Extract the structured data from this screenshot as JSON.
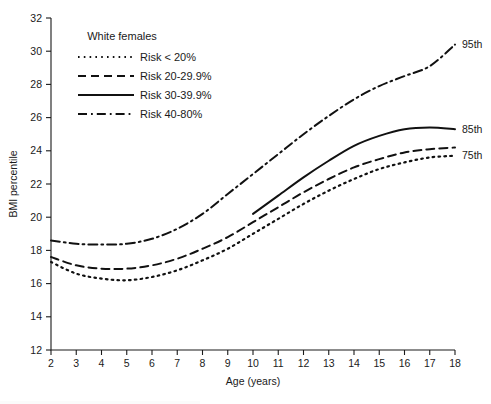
{
  "chart_data": {
    "type": "line",
    "title": "",
    "xlabel": "Age (years)",
    "ylabel": "BMI percentile",
    "xlim": [
      2,
      18
    ],
    "ylim": [
      12,
      32
    ],
    "xticks": [
      2,
      3,
      4,
      5,
      6,
      7,
      8,
      9,
      10,
      11,
      12,
      13,
      14,
      15,
      16,
      17,
      18
    ],
    "yticks": [
      12,
      14,
      16,
      18,
      20,
      22,
      24,
      26,
      28,
      30,
      32
    ],
    "grid": false,
    "legend_position": "upper-left-inside",
    "legend_title": "White females",
    "series": [
      {
        "name": "Risk < 20%",
        "style": "dotted",
        "x": [
          2,
          3,
          4,
          5,
          6,
          7,
          8,
          9,
          10,
          11,
          12,
          13,
          14,
          15,
          16,
          17,
          18
        ],
        "y": [
          17.3,
          16.6,
          16.3,
          16.2,
          16.4,
          16.8,
          17.4,
          18.1,
          19.0,
          19.9,
          20.8,
          21.6,
          22.3,
          22.9,
          23.3,
          23.6,
          23.7
        ]
      },
      {
        "name": "Risk 20-29.9%",
        "style": "dashed",
        "x": [
          2,
          3,
          4,
          5,
          6,
          7,
          8,
          9,
          10,
          11,
          12,
          13,
          14,
          15,
          16,
          17,
          18
        ],
        "y": [
          17.6,
          17.1,
          16.9,
          16.9,
          17.1,
          17.5,
          18.1,
          18.8,
          19.7,
          20.6,
          21.5,
          22.3,
          23.0,
          23.5,
          23.9,
          24.1,
          24.2
        ]
      },
      {
        "name": "Risk 30-39.9%",
        "style": "solid",
        "x": [
          10,
          11,
          12,
          13,
          14,
          15,
          16,
          17,
          18
        ],
        "y": [
          20.2,
          21.3,
          22.4,
          23.4,
          24.3,
          24.9,
          25.3,
          25.4,
          25.3
        ]
      },
      {
        "name": "Risk 40-80%",
        "style": "dashdot",
        "x": [
          2,
          3,
          4,
          5,
          6,
          7,
          8,
          9,
          10,
          11,
          12,
          13,
          14,
          15,
          16,
          17,
          18
        ],
        "y": [
          18.6,
          18.4,
          18.35,
          18.4,
          18.7,
          19.3,
          20.2,
          21.4,
          22.6,
          23.8,
          25.0,
          26.1,
          27.1,
          27.9,
          28.5,
          29.1,
          30.4
        ]
      }
    ],
    "endpoint_labels": [
      {
        "text": "95th",
        "x": 18,
        "y": 30.4
      },
      {
        "text": "85th",
        "x": 18,
        "y": 25.3
      },
      {
        "text": "75th",
        "x": 18,
        "y": 23.7
      }
    ]
  },
  "legend": {
    "title": "White females",
    "entries": [
      {
        "label": "Risk < 20%",
        "style": "dotted"
      },
      {
        "label": "Risk 20-29.9%",
        "style": "dashed"
      },
      {
        "label": "Risk 30-39.9%",
        "style": "solid"
      },
      {
        "label": "Risk 40-80%",
        "style": "dashdot"
      }
    ]
  },
  "axes": {
    "x_title": "Age (years)",
    "y_title": "BMI percentile"
  },
  "colors": {
    "ink": "#111111",
    "background": "#ffffff"
  }
}
